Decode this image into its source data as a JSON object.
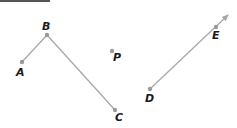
{
  "diagram": {
    "points": [
      {
        "label": "A",
        "x": 22,
        "y": 62,
        "lx": 16,
        "ly": 76
      },
      {
        "label": "B",
        "x": 47,
        "y": 35,
        "lx": 42,
        "ly": 30
      },
      {
        "label": "C",
        "x": 115,
        "y": 110,
        "lx": 115,
        "ly": 121
      },
      {
        "label": "P",
        "x": 112,
        "y": 51,
        "lx": 113,
        "ly": 61
      },
      {
        "label": "D",
        "x": 150,
        "y": 89,
        "lx": 145,
        "ly": 102
      },
      {
        "label": "E",
        "x": 216,
        "y": 27,
        "lx": 212,
        "ly": 39
      }
    ],
    "segments": [
      {
        "from": "A",
        "to": "B"
      },
      {
        "from": "B",
        "to": "C"
      }
    ],
    "rays": [
      {
        "from": "D",
        "through": "E",
        "tip": {
          "x": 228,
          "y": 15
        }
      }
    ],
    "colors": {
      "line": "#a8a8a8",
      "point": "#9a9a9a",
      "label": "#1a1a1a"
    }
  }
}
